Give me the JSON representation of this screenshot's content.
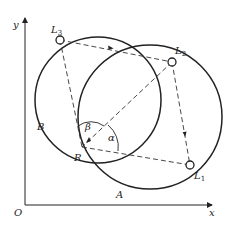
{
  "diagram": {
    "axes": {
      "x_label": "x",
      "y_label": "y",
      "origin_label": "O"
    },
    "points": {
      "L3": {
        "label": "L",
        "sub": "3"
      },
      "L2": {
        "label": "L",
        "sub": "2"
      },
      "L1": {
        "label": "L",
        "sub": "1"
      },
      "R": {
        "label": "R"
      }
    },
    "circles": {
      "A": "A",
      "B": "B"
    },
    "angles": {
      "alpha": "α",
      "beta": "β"
    },
    "colors": {
      "line": "#222222",
      "background": "#ffffff"
    }
  }
}
